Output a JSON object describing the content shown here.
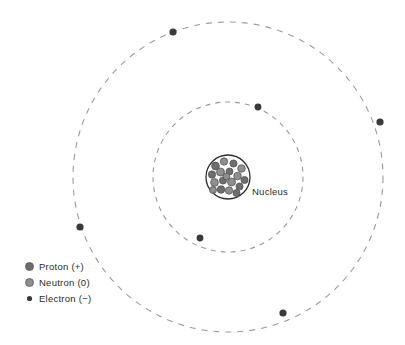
{
  "diagram": {
    "background_color": "#ffffff",
    "nucleus_label": "Nucleus",
    "center": {
      "x": 228,
      "y": 177
    },
    "orbit_color": "#9a9a9a",
    "electron_color": "#3a3a3a",
    "proton_color": "#6e6e6e",
    "neutron_color": "#8f8f8f",
    "nucleus_outline_color": "#2e2e2e",
    "nucleus_radius": 22,
    "orbits": [
      {
        "name": "inner-orbit",
        "radius": 75,
        "dash": "5 5",
        "electron_count": 2
      },
      {
        "name": "outer-orbit",
        "radius": 155,
        "dash": "6 6",
        "electron_count": 4
      }
    ],
    "electrons": [
      {
        "orbit": "outer",
        "angle_deg": 249,
        "x": 173,
        "y": 32,
        "r": 3.6
      },
      {
        "orbit": "outer",
        "angle_deg": 349,
        "x": 380,
        "y": 122,
        "r": 3.6
      },
      {
        "orbit": "outer",
        "angle_deg": 61,
        "x": 283,
        "y": 313,
        "r": 3.6
      },
      {
        "orbit": "outer",
        "angle_deg": 161,
        "x": 80,
        "y": 227,
        "r": 3.6
      },
      {
        "orbit": "inner",
        "angle_deg": 291,
        "x": 258,
        "y": 107,
        "r": 3.4
      },
      {
        "orbit": "inner",
        "angle_deg": 130,
        "x": 200,
        "y": 238,
        "r": 3.4
      }
    ],
    "nucleus_particles": [
      {
        "type": "proton",
        "x": -12.5,
        "y": -11.0,
        "r": 3.9
      },
      {
        "type": "neutron",
        "x": -4.0,
        "y": -15.5,
        "r": 3.7
      },
      {
        "type": "proton",
        "x": 5.5,
        "y": -13.5,
        "r": 3.6
      },
      {
        "type": "neutron",
        "x": 13.5,
        "y": -8.5,
        "r": 3.8
      },
      {
        "type": "proton",
        "x": -16.0,
        "y": -2.5,
        "r": 3.7
      },
      {
        "type": "neutron",
        "x": -7.5,
        "y": -5.0,
        "r": 4.0
      },
      {
        "type": "proton",
        "x": 1.5,
        "y": -5.5,
        "r": 3.5
      },
      {
        "type": "neutron",
        "x": 9.5,
        "y": -1.0,
        "r": 3.8
      },
      {
        "type": "proton",
        "x": 16.5,
        "y": 3.0,
        "r": 3.6
      },
      {
        "type": "neutron",
        "x": -13.5,
        "y": 5.5,
        "r": 3.9
      },
      {
        "type": "proton",
        "x": -5.0,
        "y": 3.5,
        "r": 3.6
      },
      {
        "type": "neutron",
        "x": 3.5,
        "y": 5.0,
        "r": 4.0
      },
      {
        "type": "proton",
        "x": 11.5,
        "y": 9.5,
        "r": 3.6
      },
      {
        "type": "neutron",
        "x": -15.0,
        "y": 13.0,
        "r": 3.5
      },
      {
        "type": "proton",
        "x": -7.0,
        "y": 12.5,
        "r": 3.8
      },
      {
        "type": "neutron",
        "x": 1.0,
        "y": 13.5,
        "r": 3.7
      },
      {
        "type": "proton",
        "x": 8.5,
        "y": 16.0,
        "r": 3.5
      },
      {
        "type": "neutron",
        "x": -1.5,
        "y": -0.5,
        "r": 3.4
      }
    ]
  },
  "legend": {
    "items": [
      {
        "key": "proton",
        "label": "Proton (+)",
        "marker": "proton-marker",
        "color": "#6e6e6e",
        "radius": 4.0
      },
      {
        "key": "neutron",
        "label": "Neutron (0)",
        "marker": "neutron-marker",
        "color": "#8f8f8f",
        "radius": 4.0
      },
      {
        "key": "electron",
        "label": "Electron (−)",
        "marker": "electron-marker",
        "color": "#3a3a3a",
        "radius": 2.6
      }
    ]
  }
}
